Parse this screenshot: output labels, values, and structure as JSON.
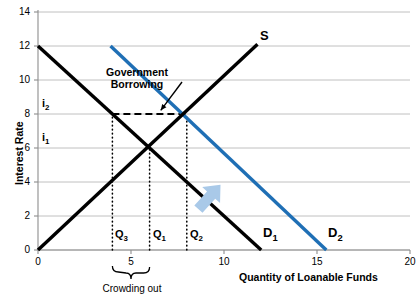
{
  "chart_data": {
    "type": "line",
    "title": "",
    "xlabel": "Quantity of Loanable Funds",
    "ylabel": "Interest Rate",
    "xlim": [
      0,
      20
    ],
    "ylim": [
      0,
      14
    ],
    "xticks": [
      "0",
      "5",
      "10",
      "15",
      "20"
    ],
    "yticks": [
      "0",
      "2",
      "4",
      "6",
      "8",
      "10",
      "12",
      "14"
    ],
    "grid": "horizontal",
    "legend": "inline-endpoint-labels",
    "series": [
      {
        "name": "D1",
        "label": "D",
        "sublabel": "1",
        "color": "#000000",
        "points": [
          [
            0,
            12
          ],
          [
            12,
            0
          ]
        ],
        "label_pos": [
          12.3,
          1.1
        ]
      },
      {
        "name": "D2",
        "label": "D",
        "sublabel": "2",
        "color": "#1F6FB5",
        "points": [
          [
            3.9,
            12
          ],
          [
            15.5,
            0
          ]
        ],
        "label_pos": [
          16.1,
          1.1
        ]
      },
      {
        "name": "S",
        "label": "S",
        "sublabel": "",
        "color": "#000000",
        "points": [
          [
            0,
            0
          ],
          [
            11.8,
            12.1
          ]
        ],
        "label_pos": [
          12.2,
          12.2
        ]
      }
    ],
    "equilibria": [
      {
        "name": "initial",
        "x": 6,
        "y": 6,
        "x_label": "Q1",
        "y_label": "i1"
      },
      {
        "name": "after-government-borrowing",
        "x": 8,
        "y": 8,
        "x_label": "Q2",
        "y_label": "i2"
      }
    ],
    "markers": [
      {
        "name": "Q3",
        "x": 4,
        "type": "dotted-vertical",
        "from_y": 0,
        "to_y": 8
      },
      {
        "name": "Q1",
        "x": 6,
        "type": "dotted-vertical",
        "from_y": 0,
        "to_y": 6
      },
      {
        "name": "Q2",
        "x": 8,
        "type": "dotted-vertical",
        "from_y": 0,
        "to_y": 8
      },
      {
        "name": "i2-dashed",
        "y": 8,
        "type": "dashed-horizontal",
        "from_x": 4,
        "to_x": 8
      }
    ],
    "annotations": [
      {
        "name": "government-borrowing",
        "text_line1": "Government",
        "text_line2": "Borrowing",
        "arrow_to": [
          6.6,
          8.1
        ]
      },
      {
        "name": "shift-arrow",
        "type": "arrow",
        "color": "#A9C9E8",
        "direction": "up-right",
        "at": [
          9.2,
          3.1
        ]
      },
      {
        "name": "crowding-out-brace",
        "text": "Crowding out",
        "from_x": 4,
        "to_x": 6
      }
    ],
    "axis_tick_labels": {
      "q3": "Q",
      "q3_sub": "3",
      "q1": "Q",
      "q1_sub": "1",
      "q2": "Q",
      "q2_sub": "2",
      "i1": "i",
      "i1_sub": "1",
      "i2": "i",
      "i2_sub": "2"
    }
  },
  "labels": {
    "y_axis_title": "Interest Rate",
    "x_axis_title": "Quantity of Loanable Funds",
    "gov_borrowing_line1": "Government",
    "gov_borrowing_line2": "Borrowing",
    "crowding_out": "Crowding out"
  }
}
